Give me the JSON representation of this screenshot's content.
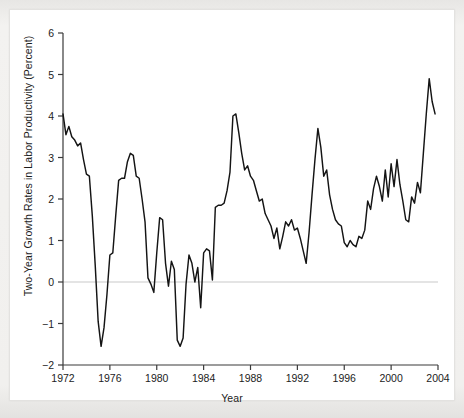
{
  "figure": {
    "background_color": "#ffffff",
    "page_color": "#efeeec",
    "line_color": "#141414",
    "zero_line_color": "#c9c9c9",
    "axis_color": "#3a3a3a"
  },
  "chart_data": {
    "type": "line",
    "title": "",
    "xlabel": "Year",
    "ylabel": "Two-Year Growth Rates in Labor Productivity (Percent)",
    "xlim": [
      1972,
      2004
    ],
    "ylim": [
      -2,
      6
    ],
    "xticks": [
      1972,
      1976,
      1980,
      1984,
      1988,
      1992,
      1996,
      2000,
      2004
    ],
    "xticklabels": [
      "1972",
      "1976",
      "1980",
      "1984",
      "1988",
      "1992",
      "1996",
      "2000",
      "2004"
    ],
    "yticks": [
      -2,
      -1,
      0,
      1,
      2,
      3,
      4,
      5,
      6
    ],
    "yticklabels": [
      "−2",
      "−1",
      "0",
      "1",
      "2",
      "3",
      "4",
      "5",
      "6"
    ],
    "grid": false,
    "legend": "none",
    "zero_reference_line": 0,
    "annotations": [],
    "series": [
      {
        "name": "Two-Year Growth Rate in Labor Productivity",
        "x": [
          1972.0,
          1972.25,
          1972.5,
          1972.75,
          1973.0,
          1973.25,
          1973.5,
          1973.75,
          1974.0,
          1974.25,
          1974.5,
          1974.75,
          1975.0,
          1975.25,
          1975.5,
          1975.75,
          1976.0,
          1976.25,
          1976.5,
          1976.75,
          1977.0,
          1977.25,
          1977.5,
          1977.75,
          1978.0,
          1978.25,
          1978.5,
          1978.75,
          1979.0,
          1979.25,
          1979.5,
          1979.75,
          1980.0,
          1980.25,
          1980.5,
          1980.75,
          1981.0,
          1981.25,
          1981.5,
          1981.75,
          1982.0,
          1982.25,
          1982.5,
          1982.75,
          1983.0,
          1983.25,
          1983.5,
          1983.75,
          1984.0,
          1984.25,
          1984.5,
          1984.75,
          1985.0,
          1985.25,
          1985.5,
          1985.75,
          1986.0,
          1986.25,
          1986.5,
          1986.75,
          1987.0,
          1987.25,
          1987.5,
          1987.75,
          1988.0,
          1988.25,
          1988.5,
          1988.75,
          1989.0,
          1989.25,
          1989.5,
          1989.75,
          1990.0,
          1990.25,
          1990.5,
          1990.75,
          1991.0,
          1991.25,
          1991.5,
          1991.75,
          1992.0,
          1992.25,
          1992.5,
          1992.75,
          1993.0,
          1993.25,
          1993.5,
          1993.75,
          1994.0,
          1994.25,
          1994.5,
          1994.75,
          1995.0,
          1995.25,
          1995.5,
          1995.75,
          1996.0,
          1996.25,
          1996.5,
          1996.75,
          1997.0,
          1997.25,
          1997.5,
          1997.75,
          1998.0,
          1998.25,
          1998.5,
          1998.75,
          1999.0,
          1999.25,
          1999.5,
          1999.75,
          2000.0,
          2000.25,
          2000.5,
          2000.75,
          2001.0,
          2001.25,
          2001.5,
          2001.75,
          2002.0,
          2002.25,
          2002.5,
          2002.75,
          2003.0,
          2003.25,
          2003.5,
          2003.75
        ],
        "y": [
          4.05,
          3.55,
          3.75,
          3.5,
          3.42,
          3.28,
          3.35,
          2.95,
          2.6,
          2.55,
          1.6,
          0.4,
          -0.95,
          -1.55,
          -1.1,
          -0.3,
          0.65,
          0.7,
          1.6,
          2.45,
          2.5,
          2.5,
          2.9,
          3.1,
          3.05,
          2.55,
          2.5,
          2.0,
          1.45,
          0.1,
          -0.05,
          -0.25,
          0.7,
          1.55,
          1.5,
          0.45,
          -0.1,
          0.5,
          0.3,
          -1.4,
          -1.55,
          -1.35,
          -0.05,
          0.65,
          0.45,
          0.0,
          0.35,
          -0.62,
          0.7,
          0.8,
          0.75,
          0.05,
          1.8,
          1.85,
          1.85,
          1.9,
          2.2,
          2.65,
          4.0,
          4.05,
          3.6,
          3.1,
          2.7,
          2.8,
          2.55,
          2.45,
          2.2,
          1.95,
          2.0,
          1.65,
          1.5,
          1.35,
          1.05,
          1.3,
          0.8,
          1.1,
          1.45,
          1.35,
          1.5,
          1.25,
          1.3,
          1.05,
          0.75,
          0.45,
          1.2,
          2.1,
          2.95,
          3.7,
          3.25,
          2.55,
          2.7,
          2.1,
          1.75,
          1.5,
          1.4,
          1.35,
          0.95,
          0.85,
          1.0,
          0.9,
          0.85,
          1.1,
          1.05,
          1.25,
          1.95,
          1.75,
          2.25,
          2.55,
          2.3,
          1.95,
          2.7,
          2.05,
          2.85,
          2.3,
          2.95,
          2.35,
          1.95,
          1.5,
          1.45,
          2.05,
          1.9,
          2.4,
          2.15,
          3.1,
          4.05,
          4.9,
          4.35,
          4.05
        ]
      }
    ]
  }
}
